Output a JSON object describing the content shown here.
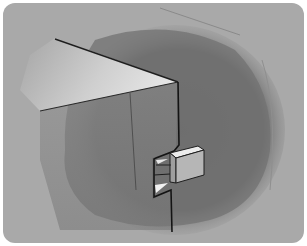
{
  "illustration": {
    "subject": "pencil sketch of a box corner with a small protruding block (tab/latch) on its front edge",
    "style": "grayscale shaded drawing",
    "colors": {
      "page_background": "#ffffff",
      "panel_gray": "#a9a9a9",
      "shadow_blob": "#707070",
      "top_face_light": "#d6d6d6",
      "front_face": "#8a8a8a",
      "block_top": "#ececec",
      "block_front": "#b4b4b4",
      "block_side": "#9a9a9a",
      "outline": "#1e1e1e"
    }
  }
}
